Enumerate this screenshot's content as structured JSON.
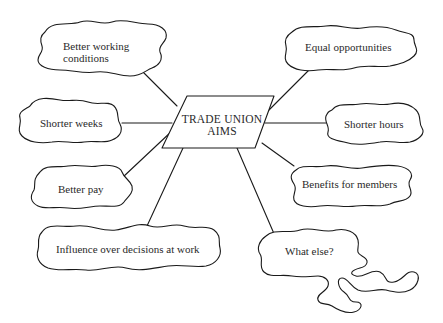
{
  "diagram": {
    "type": "mind-map",
    "center": {
      "line1": "TRADE UNION",
      "line2": "AIMS"
    },
    "nodes": [
      {
        "id": "better-working-conditions",
        "line1": "Better working",
        "line2": "conditions"
      },
      {
        "id": "shorter-weeks",
        "label": "Shorter weeks"
      },
      {
        "id": "better-pay",
        "label": "Better pay"
      },
      {
        "id": "influence",
        "label": "Influence over decisions at work"
      },
      {
        "id": "equal-opportunities",
        "label": "Equal opportunities"
      },
      {
        "id": "shorter-hours",
        "label": "Shorter hours"
      },
      {
        "id": "benefits",
        "label": "Benefits for members"
      },
      {
        "id": "what-else",
        "label": "What else?"
      }
    ],
    "stroke_color": "#1a1a1a",
    "text_color": "#2a2a2a"
  }
}
